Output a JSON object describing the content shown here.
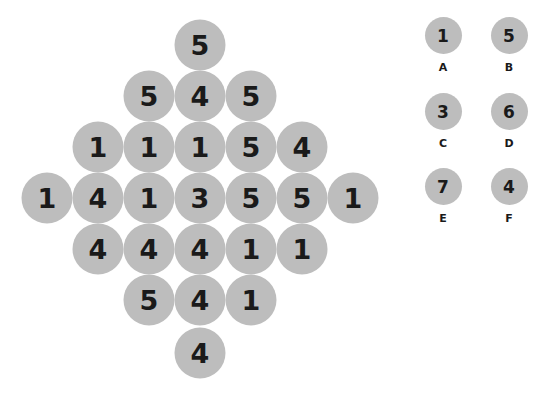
{
  "puzzle": {
    "rows": [
      [
        "5"
      ],
      [
        "5",
        "4",
        "5"
      ],
      [
        "1",
        "1",
        "1",
        "5",
        "4"
      ],
      [
        "1",
        "4",
        "1",
        "3",
        "5",
        "5",
        "1"
      ],
      [
        "4",
        "4",
        "4",
        "1",
        "1"
      ],
      [
        "5",
        "4",
        "1"
      ],
      [
        "4"
      ]
    ]
  },
  "options": [
    {
      "value": "1",
      "label": "A"
    },
    {
      "value": "5",
      "label": "B"
    },
    {
      "value": "3",
      "label": "C"
    },
    {
      "value": "6",
      "label": "D"
    },
    {
      "value": "7",
      "label": "E"
    },
    {
      "value": "4",
      "label": "F"
    }
  ],
  "colors": {
    "circle": "#bdbdbd",
    "text": "#1a1a1a",
    "background": "#ffffff"
  }
}
